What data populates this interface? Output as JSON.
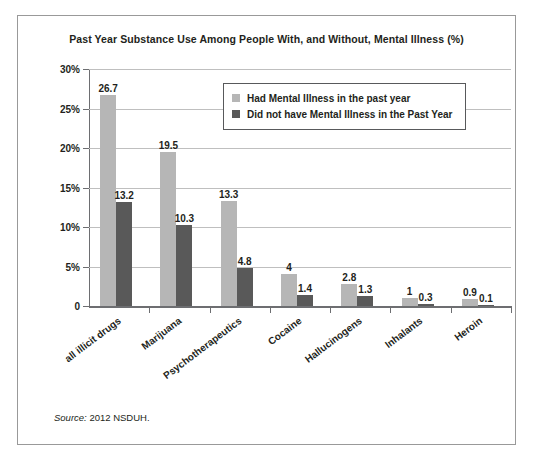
{
  "figure": {
    "title": "Past Year Substance Use Among People With, and Without, Mental Illness (%)",
    "source_lead": "Source:",
    "source_text": "2012 NSDUH."
  },
  "legend": {
    "entries": [
      {
        "label": "Had Mental Illness in the past year",
        "color": "#b6b6b6",
        "swatch_name": "legend-swatch-had-mental-illness"
      },
      {
        "label": "Did not have Mental Illness in the Past Year",
        "color": "#595959",
        "swatch_name": "legend-swatch-no-mental-illness"
      }
    ]
  },
  "axes": {
    "y_tick_labels": [
      "30%",
      "25%",
      "20%",
      "15%",
      "10%",
      "5%",
      "0"
    ],
    "y_tick_values": [
      30,
      25,
      20,
      15,
      10,
      5,
      0
    ]
  },
  "chart_data": {
    "type": "bar",
    "title": "Past Year Substance Use Among People With, and Without, Mental Illness (%)",
    "xlabel": "",
    "ylabel": "",
    "ylim": [
      0,
      30
    ],
    "ytick_step": 5,
    "grid": true,
    "legend_position": "top-center-inside",
    "orientation": "vertical",
    "grouping": "grouped",
    "categories": [
      "all illicit drugs",
      "Marijuana",
      "Psychotherapeutics",
      "Cocaine",
      "Hallucinogens",
      "Inhalants",
      "Heroin"
    ],
    "series": [
      {
        "name": "Had Mental Illness in the past year",
        "color": "#b6b6b6",
        "values": [
          26.7,
          19.5,
          13.3,
          4,
          2.8,
          1,
          0.9
        ],
        "labels": [
          "26.7",
          "19.5",
          "13.3",
          "4",
          "2.8",
          "1",
          "0.9"
        ]
      },
      {
        "name": "Did not have Mental Illness in the Past Year",
        "color": "#595959",
        "values": [
          13.2,
          10.3,
          4.8,
          1.4,
          1.3,
          0.3,
          0.1
        ],
        "labels": [
          "13.2",
          "10.3",
          "4.8",
          "1.4",
          "1.3",
          "0.3",
          "0.1"
        ]
      }
    ],
    "annotations": [
      "Source: 2012 NSDUH."
    ]
  }
}
